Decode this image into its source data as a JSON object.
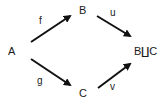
{
  "diagram": {
    "type": "commutative-diagram",
    "nodes": {
      "A": "A",
      "B": "B",
      "C": "C",
      "coproduct": "B∐C"
    },
    "edges": [
      {
        "from": "A",
        "to": "B",
        "label": "f"
      },
      {
        "from": "A",
        "to": "C",
        "label": "g"
      },
      {
        "from": "B",
        "to": "B∐C",
        "label": "u"
      },
      {
        "from": "C",
        "to": "B∐C",
        "label": "v"
      }
    ],
    "arrow_color": "#111111"
  }
}
